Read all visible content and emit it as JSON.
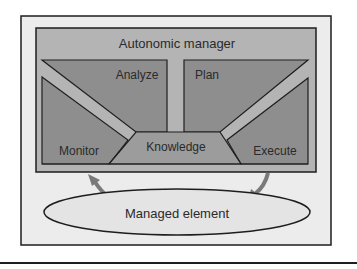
{
  "diagram": {
    "title": "Autonomic manager",
    "components": {
      "analyze": "Analyze",
      "plan": "Plan",
      "monitor": "Monitor",
      "execute": "Execute",
      "knowledge": "Knowledge"
    },
    "managed_element": "Managed element",
    "arrows": [
      {
        "from": "Managed element",
        "to": "Monitor",
        "direction": "up"
      },
      {
        "from": "Execute",
        "to": "Managed element",
        "direction": "down"
      }
    ],
    "colors": {
      "frame_fill": "#ececec",
      "manager_fill": "#b4b4b4",
      "quadrant_fill": "#8e8e8e",
      "knowledge_fill": "#9c9c9c",
      "ellipse_fill": "#e4e4e4",
      "arrow": "#7a7a7a",
      "stroke": "#1e1e1e"
    }
  }
}
